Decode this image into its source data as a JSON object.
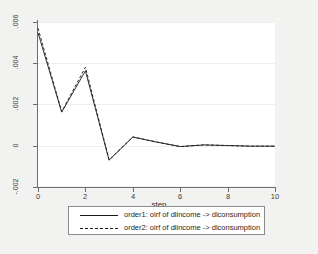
{
  "chart_data": {
    "type": "line",
    "title": "",
    "xlabel": "step",
    "ylabel": "",
    "xlim": [
      0,
      10
    ],
    "ylim": [
      -0.002,
      0.006
    ],
    "grid": true,
    "legend_position": "bottom",
    "x": [
      0,
      1,
      2,
      3,
      4,
      5,
      6,
      7,
      8,
      9,
      10
    ],
    "xticks": [
      "0",
      "2",
      "4",
      "6",
      "8",
      "10"
    ],
    "xtick_values": [
      0,
      2,
      4,
      6,
      8,
      10
    ],
    "yticks": [
      "-.002",
      "0",
      ".002",
      ".004",
      ".006"
    ],
    "ytick_values": [
      -0.002,
      0,
      0.002,
      0.004,
      0.006
    ],
    "series": [
      {
        "name": "order1: oirf of dlincome -> dlconsumption",
        "style": "solid",
        "color": "#1a1a1a",
        "values": [
          0.00548,
          0.00163,
          0.00363,
          -0.0007,
          0.00042,
          0.00018,
          -4e-05,
          4e-05,
          1e-05,
          -2e-05,
          -2e-05
        ]
      },
      {
        "name": "order2: oirf of dlincome -> dlconsumption",
        "style": "dashed",
        "color": "#1a1a1a",
        "values": [
          0.0057,
          0.00165,
          0.00381,
          -0.00068,
          0.00043,
          0.00018,
          -4e-05,
          4e-05,
          1e-05,
          -2e-05,
          -2e-05
        ]
      }
    ]
  },
  "axis": {
    "x_title": "step",
    "x_tick_labels": [
      "0",
      "2",
      "4",
      "6",
      "8",
      "10"
    ],
    "y_tick_labels": [
      ".006",
      ".004",
      ".002",
      "0",
      "-.002"
    ]
  },
  "legend": {
    "entries": [
      {
        "label": "order1: oirf of dlincome -> dlconsumption",
        "style": "solid"
      },
      {
        "label": "order2: oirf of dlincome -> dlconsumption",
        "style": "dashed"
      }
    ]
  },
  "colors": {
    "background": "#f2f2f0",
    "plot_background": "#ffffff",
    "axis": "#6e6e6e",
    "line": "#1a1a1a",
    "grid": "#efefef"
  }
}
